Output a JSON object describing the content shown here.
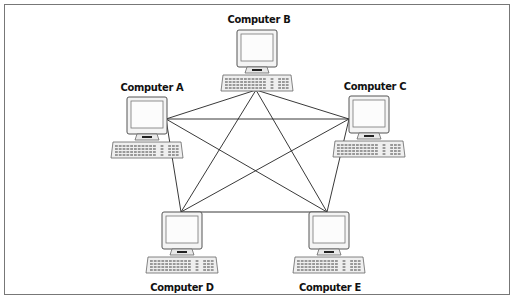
{
  "diagram": {
    "type": "full-mesh network topology",
    "nodes": [
      {
        "id": "A",
        "label": "Computer A"
      },
      {
        "id": "B",
        "label": "Computer B"
      },
      {
        "id": "C",
        "label": "Computer C"
      },
      {
        "id": "D",
        "label": "Computer D"
      },
      {
        "id": "E",
        "label": "Computer E"
      }
    ],
    "edges": [
      [
        "A",
        "B"
      ],
      [
        "A",
        "C"
      ],
      [
        "A",
        "D"
      ],
      [
        "A",
        "E"
      ],
      [
        "B",
        "C"
      ],
      [
        "B",
        "D"
      ],
      [
        "B",
        "E"
      ],
      [
        "C",
        "D"
      ],
      [
        "C",
        "E"
      ],
      [
        "D",
        "E"
      ]
    ]
  }
}
